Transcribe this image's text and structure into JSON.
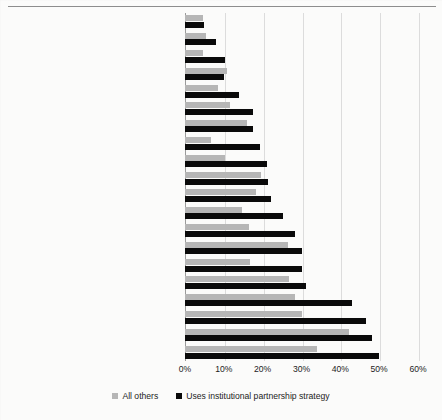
{
  "chart_data": {
    "type": "bar",
    "orientation": "horizontal",
    "title": "",
    "xlabel": "",
    "ylabel": "",
    "xlim": [
      0,
      60
    ],
    "xticks": [
      "0%",
      "10%",
      "20%",
      "30%",
      "40%",
      "50%",
      "60%"
    ],
    "xtick_values": [
      0,
      10,
      20,
      30,
      40,
      50,
      60
    ],
    "grid": "vertical",
    "legend_position": "bottom",
    "legend": [
      "All others",
      "Uses institutional partnership strategy"
    ],
    "categories": [
      "defense, national security",
      "recreation, sports, leisure",
      "foreign relations, trade",
      "arts, culture, religion",
      "science, technology, research",
      "transportation",
      "agriculture, food, nutrition",
      "taxes, monetary policy",
      "public safety, emergency preparedness",
      "environment, natural resources, engery",
      "housing, shelter",
      "immigration, immigrants",
      "economy, jobs, business",
      "youth development",
      "crime, criminal justice",
      "community development",
      "civil rights",
      "social welfare, poverty",
      "education",
      "health, mental health"
    ],
    "series": [
      {
        "name": "All others",
        "color": "#b6b6b6",
        "values": [
          4.6,
          5.3,
          4.7,
          10.9,
          8.6,
          11.6,
          16.0,
          6.7,
          10.3,
          19.6,
          18.2,
          14.8,
          16.6,
          26.5,
          16.8,
          26.7,
          28.4,
          30.0,
          42.2,
          34.1
        ]
      },
      {
        "name": "Uses institutional partnership strategy",
        "color": "#0a0a0a",
        "values": [
          4.9,
          7.9,
          10.2,
          10.1,
          14.0,
          17.5,
          17.6,
          19.4,
          21.1,
          21.4,
          22.2,
          25.2,
          28.4,
          30.0,
          30.0,
          31.2,
          43.1,
          46.5,
          48.1,
          50.0
        ]
      }
    ]
  },
  "legend": {
    "items": [
      {
        "label": "All others",
        "swatch": "gray"
      },
      {
        "label": "Uses institutional partnership strategy",
        "swatch": "black"
      }
    ]
  }
}
